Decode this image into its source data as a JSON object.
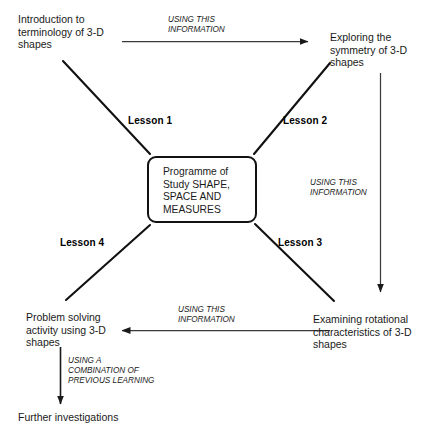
{
  "diagram": {
    "center": {
      "label": "Programme of\nStudy SHAPE,\nSPACE AND\nMEASURES"
    },
    "nodes": [
      {
        "id": "intro",
        "label": "Introduction to\nterminology of 3-D\nshapes"
      },
      {
        "id": "symmetry",
        "label": "Exploring the\nsymmetry of 3-D\nshapes"
      },
      {
        "id": "rotational",
        "label": "Examining rotational\ncharacteristics of 3-D\nshapes"
      },
      {
        "id": "problem-solving",
        "label": "Problem solving\nactivity using 3-D\nshapes"
      },
      {
        "id": "further",
        "label": "Further investigations"
      }
    ],
    "lessons": [
      {
        "id": "lesson-1",
        "label": "Lesson 1"
      },
      {
        "id": "lesson-2",
        "label": "Lesson 2"
      },
      {
        "id": "lesson-3",
        "label": "Lesson 3"
      },
      {
        "id": "lesson-4",
        "label": "Lesson 4"
      }
    ],
    "edge_labels": [
      {
        "id": "top",
        "label": "USING THIS\nINFORMATION"
      },
      {
        "id": "right",
        "label": "USING THIS\nINFORMATION"
      },
      {
        "id": "bottom",
        "label": "USING THIS\nINFORMATION"
      },
      {
        "id": "left-down",
        "label": "USING A\nCOMBINATION OF\nPREVIOUS LEARNING"
      }
    ],
    "colors": {
      "stroke": "#111111",
      "arrow_stroke": "#3a3a3a",
      "text": "#1a1a1a",
      "background": "#ffffff"
    }
  }
}
